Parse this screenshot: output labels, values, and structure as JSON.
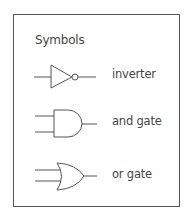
{
  "title": "Symbols",
  "symbols": [
    {
      "id": "inverter",
      "label": "inverter",
      "icon": "not-gate-icon"
    },
    {
      "id": "and",
      "label": "and gate",
      "icon": "and-gate-icon"
    },
    {
      "id": "or",
      "label": "or gate",
      "icon": "or-gate-icon"
    }
  ],
  "colors": {
    "stroke": "#555555",
    "text": "#444444",
    "background": "#ffffff"
  }
}
